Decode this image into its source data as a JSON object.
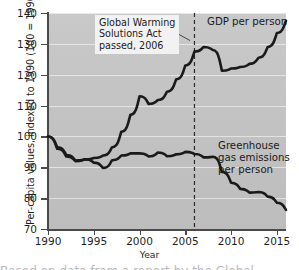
{
  "chart_data": {
    "type": "line",
    "title": "",
    "xlabel": "Year",
    "ylabel": "Per-capita values, indexed to 1990 (100 = 1990 values)",
    "xlim": [
      1990,
      2016
    ],
    "ylim": [
      70,
      140
    ],
    "grid": true,
    "legend_position": "inline-labels",
    "xticks": [
      "1990",
      "1995",
      "2000",
      "2005",
      "2010",
      "2015"
    ],
    "xtick_values": [
      1990,
      1995,
      2000,
      2005,
      2010,
      2015
    ],
    "yticks": [
      "70",
      "80",
      "90",
      "100",
      "110",
      "120",
      "130",
      "140"
    ],
    "ytick_values": [
      70,
      80,
      90,
      100,
      110,
      120,
      130,
      140
    ],
    "x": [
      1990,
      1991,
      1992,
      1993,
      1994,
      1995,
      1996,
      1997,
      1998,
      1999,
      2000,
      2001,
      2002,
      2003,
      2004,
      2005,
      2006,
      2007,
      2008,
      2009,
      2010,
      2011,
      2012,
      2013,
      2014,
      2015,
      2016
    ],
    "series": [
      {
        "name": "GDP per person",
        "color": "#1a1a1a",
        "values": [
          100.0,
          96.5,
          94.0,
          92.2,
          92.5,
          93.0,
          93.8,
          96.5,
          101.5,
          107.0,
          113.0,
          110.5,
          111.8,
          114.5,
          118.5,
          123.0,
          127.5,
          129.0,
          128.0,
          121.3,
          122.0,
          122.5,
          123.5,
          125.5,
          129.0,
          133.5,
          137.5
        ]
      },
      {
        "name": "Greenhouse gas emissions per person",
        "color": "#1a1a1a",
        "values": [
          100.0,
          96.0,
          93.5,
          92.0,
          92.6,
          91.5,
          89.8,
          92.3,
          93.8,
          94.5,
          94.5,
          93.5,
          94.8,
          93.6,
          94.2,
          95.0,
          94.3,
          93.2,
          93.4,
          88.5,
          85.0,
          83.0,
          81.8,
          82.0,
          80.5,
          78.5,
          76.2
        ]
      }
    ],
    "annotations": [
      {
        "text": "Global Warming\nSolutions Act\npassed, 2006",
        "target_x": 2006,
        "type": "boxed-callout-with-leader"
      },
      {
        "text": "GDP per person",
        "type": "series-label"
      },
      {
        "text": "Greenhouse\ngas emissions\nper person",
        "type": "series-label"
      }
    ],
    "reference_lines": [
      {
        "x": 2006,
        "style": "dashed",
        "color": "#2b2b2b"
      }
    ]
  },
  "figure": {
    "axis_title_y": "Per-capita values, indexed to 1990 (100 = 1990 values)",
    "axis_title_x": "Year",
    "annotation_text": "Global Warming\nSolutions Act\npassed, 2006",
    "label_gdp": "GDP per person",
    "label_ghg": "Greenhouse\ngas emissions\nper person",
    "caption_fragment": "Based on data from a report by the Global"
  }
}
